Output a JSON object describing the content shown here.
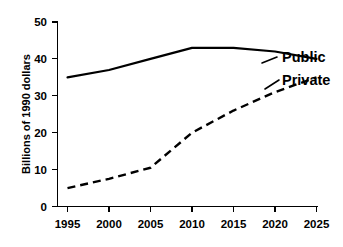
{
  "chart_data": {
    "type": "line",
    "title": "",
    "xlabel": "",
    "ylabel": "Billions of 1990 dollars",
    "xlim": [
      1995,
      2025
    ],
    "ylim": [
      0,
      50
    ],
    "xticks": [
      1995,
      2000,
      2005,
      2010,
      2015,
      2020,
      2025
    ],
    "yticks": [
      0,
      10,
      20,
      30,
      40,
      50
    ],
    "grid": false,
    "legend_position": "inline-right-end-labels",
    "x": [
      1995,
      2000,
      2005,
      2010,
      2015,
      2020,
      2025
    ],
    "series": [
      {
        "name": "Public",
        "style": "solid",
        "color": "#000000",
        "values": [
          35,
          37,
          40,
          43,
          43,
          42,
          40
        ]
      },
      {
        "name": "Private",
        "style": "dashed",
        "color": "#000000",
        "values": [
          5,
          7.5,
          10.5,
          20,
          26,
          31,
          35
        ]
      }
    ]
  },
  "axes": {
    "y_title": "Billions of 1990 dollars",
    "y_tick_labels": [
      "50",
      "40",
      "30",
      "20",
      "10",
      "0"
    ],
    "x_tick_labels": [
      "1995",
      "2000",
      "2005",
      "2010",
      "2015",
      "2020",
      "2025"
    ]
  },
  "labels": {
    "public": "Public",
    "private": "Private"
  },
  "colors": {
    "line": "#000000",
    "background": "#ffffff",
    "axis": "#000000"
  }
}
